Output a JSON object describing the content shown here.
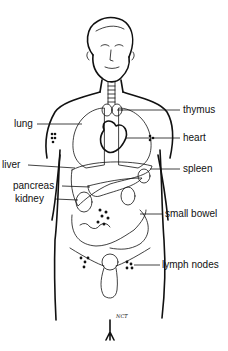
{
  "diagram": {
    "title": "",
    "signature": "NCT",
    "labels": {
      "left": [
        {
          "key": "lung",
          "text": "lung"
        },
        {
          "key": "liver",
          "text": "liver"
        },
        {
          "key": "pancreas",
          "text": "pancreas"
        },
        {
          "key": "kidney",
          "text": "kidney"
        }
      ],
      "right": [
        {
          "key": "thymus",
          "text": "thymus"
        },
        {
          "key": "heart",
          "text": "heart"
        },
        {
          "key": "spleen",
          "text": "spleen"
        },
        {
          "key": "small-bowel",
          "text": "small bowel"
        },
        {
          "key": "lymph-nodes",
          "text": "lymph nodes"
        }
      ]
    }
  }
}
